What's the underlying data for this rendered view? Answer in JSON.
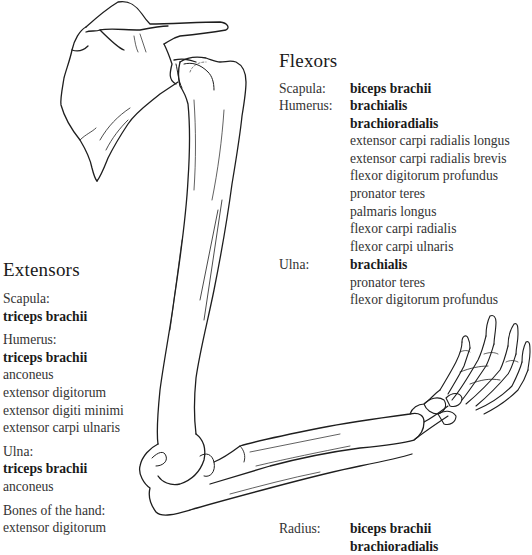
{
  "diagram": {
    "line_color": "#1e1e1e"
  },
  "flexors": {
    "title": "Flexors",
    "groups": [
      {
        "label": "Scapula:",
        "muscles": [
          {
            "name": "biceps brachii",
            "primary": true
          }
        ]
      },
      {
        "label": "Humerus:",
        "muscles": [
          {
            "name": "brachialis",
            "primary": true
          },
          {
            "name": "brachioradialis",
            "primary": true
          },
          {
            "name": "extensor carpi radialis longus",
            "primary": false
          },
          {
            "name": "extensor carpi radialis brevis",
            "primary": false
          },
          {
            "name": "flexor digitorum profundus",
            "primary": false
          },
          {
            "name": "pronator teres",
            "primary": false
          },
          {
            "name": "palmaris longus",
            "primary": false
          },
          {
            "name": "flexor carpi radialis",
            "primary": false
          },
          {
            "name": "flexor carpi ulnaris",
            "primary": false
          }
        ]
      },
      {
        "label": "Ulna:",
        "muscles": [
          {
            "name": "brachialis",
            "primary": true
          },
          {
            "name": "pronator teres",
            "primary": false
          },
          {
            "name": "flexor digitorum profundus",
            "primary": false
          }
        ]
      },
      {
        "label": "Radius:",
        "muscles": [
          {
            "name": "biceps brachii",
            "primary": true
          },
          {
            "name": "brachioradialis",
            "primary": true
          }
        ]
      }
    ]
  },
  "extensors": {
    "title": "Extensors",
    "groups": [
      {
        "label": "Scapula:",
        "muscles": [
          {
            "name": "triceps brachii",
            "primary": true
          }
        ]
      },
      {
        "label": "Humerus:",
        "muscles": [
          {
            "name": "triceps brachii",
            "primary": true
          },
          {
            "name": "anconeus",
            "primary": false
          },
          {
            "name": "extensor digitorum",
            "primary": false
          },
          {
            "name": "extensor digiti minimi",
            "primary": false
          },
          {
            "name": "extensor carpi ulnaris",
            "primary": false
          }
        ]
      },
      {
        "label": "Ulna:",
        "muscles": [
          {
            "name": "triceps brachii",
            "primary": true
          },
          {
            "name": "anconeus",
            "primary": false
          }
        ]
      },
      {
        "label": "Bones of the hand:",
        "muscles": [
          {
            "name": "extensor digitorum",
            "primary": false
          }
        ]
      }
    ]
  }
}
